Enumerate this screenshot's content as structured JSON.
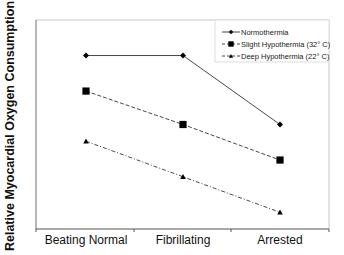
{
  "chart_data": {
    "type": "line",
    "title": "",
    "xlabel": "",
    "ylabel": "Relative Myocardial Oxygen Consumption",
    "categories": [
      "Beating Normal",
      "Fibrillating",
      "Arrested"
    ],
    "ylim": [
      0,
      100
    ],
    "y_ticks_shown": false,
    "grid": false,
    "legend_position": "upper right",
    "series": [
      {
        "name": "Normothermia",
        "marker": "diamond",
        "line_style": "solid",
        "values": [
          83,
          83,
          50
        ]
      },
      {
        "name": "Slight Hypothermia (32° C)",
        "marker": "square",
        "line_style": "dashed",
        "values": [
          66,
          50,
          33
        ]
      },
      {
        "name": "Deep Hypothermia (22° C)",
        "marker": "triangle",
        "line_style": "dash-dot",
        "values": [
          42,
          25,
          8
        ]
      }
    ]
  },
  "axis": {
    "y_label": "Relative Myocardial Oxygen Consumption",
    "x_labels": [
      "Beating Normal",
      "Fibrillating",
      "Arrested"
    ]
  },
  "legend": {
    "items": [
      {
        "label": "Normothermia",
        "icon": "diamond-marker-icon"
      },
      {
        "label": "Slight Hypothermia (32° C)",
        "icon": "square-marker-icon"
      },
      {
        "label": "Deep Hypothermia (22° C)",
        "icon": "triangle-marker-icon"
      }
    ]
  },
  "colors": {
    "line": "#333333",
    "marker": "#000000",
    "axis": "#555555",
    "frame": "#bbbbbb"
  }
}
